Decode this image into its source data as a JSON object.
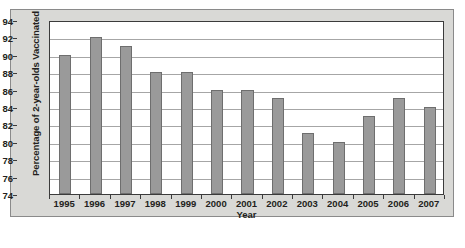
{
  "chart_data": {
    "type": "bar",
    "title": "",
    "xlabel": "Year",
    "ylabel": "Percentage of 2-year-olds Vaccinated",
    "categories": [
      "1995",
      "1996",
      "1997",
      "1998",
      "1999",
      "2000",
      "2001",
      "2002",
      "2003",
      "2004",
      "2005",
      "2006",
      "2007"
    ],
    "values": [
      90,
      92,
      91,
      88,
      88,
      86,
      86,
      85,
      81,
      80,
      83,
      85,
      84
    ],
    "series": [
      {
        "name": "Percentage of 2-year-olds Vaccinated",
        "values": [
          90,
          92,
          91,
          88,
          88,
          86,
          86,
          85,
          81,
          80,
          83,
          85,
          84
        ]
      }
    ],
    "ylim": [
      74,
      94
    ],
    "ytick_labels": [
      "74",
      "76",
      "78",
      "80",
      "82",
      "84",
      "86",
      "88",
      "90",
      "92",
      "94"
    ],
    "ytick_values": [
      74,
      76,
      78,
      80,
      82,
      84,
      86,
      88,
      90,
      92,
      94
    ],
    "grid": true,
    "grid_axis": "y",
    "legend": false,
    "legend_position": "none",
    "bar_color": "#9a9a9a",
    "bar_edge_color": "#6e6e6e",
    "gridline_color": "#a6a6a6",
    "axis_color": "#3b3b3b",
    "plot_background": "#ffffff",
    "panel_background": "#d9d9d6",
    "text_color": "#231f20"
  }
}
